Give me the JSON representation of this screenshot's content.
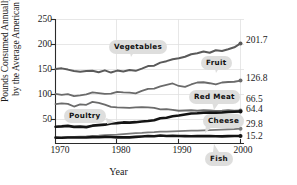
{
  "chart_data": {
    "type": "line",
    "title": "",
    "xlabel": "Year",
    "ylabel_line1": "Pounds Consumed Annually",
    "ylabel_line2": "by the Average American",
    "xlim": [
      1970,
      2000
    ],
    "ylim": [
      0,
      250
    ],
    "yticks": [
      250,
      200,
      150,
      100,
      50
    ],
    "xticks": [
      1970,
      1980,
      1990,
      2000
    ],
    "grid": true,
    "legend": "inline-callouts",
    "end_value_labels": [
      "201.7",
      "126.8",
      "66.5",
      "64.4",
      "29.8",
      "15.2"
    ],
    "series": [
      {
        "name": "Vegetables",
        "color": "#5a5a5a",
        "width": 2.0,
        "end_value": 201.7,
        "x": [
          1970,
          1971,
          1972,
          1973,
          1974,
          1975,
          1976,
          1977,
          1978,
          1979,
          1980,
          1981,
          1982,
          1983,
          1984,
          1985,
          1986,
          1987,
          1988,
          1989,
          1990,
          1991,
          1992,
          1993,
          1994,
          1995,
          1996,
          1997,
          1998,
          1999,
          2000
        ],
        "values": [
          150.0,
          151.5,
          149.0,
          146.0,
          144.5,
          146.0,
          146.5,
          143.5,
          147.5,
          143.0,
          147.0,
          145.0,
          148.0,
          146.5,
          151.0,
          156.0,
          157.0,
          163.0,
          166.0,
          170.0,
          172.0,
          175.0,
          180.0,
          182.0,
          185.5,
          183.0,
          188.0,
          186.5,
          190.0,
          194.0,
          201.7
        ]
      },
      {
        "name": "Fruit",
        "color": "#6b6b6b",
        "width": 1.8,
        "end_value": 126.8,
        "x": [
          1970,
          1971,
          1972,
          1973,
          1974,
          1975,
          1976,
          1977,
          1978,
          1979,
          1980,
          1981,
          1982,
          1983,
          1984,
          1985,
          1986,
          1987,
          1988,
          1989,
          1990,
          1991,
          1992,
          1993,
          1994,
          1995,
          1996,
          1997,
          1998,
          1999,
          2000
        ],
        "values": [
          100.0,
          98.0,
          99.5,
          95.5,
          97.0,
          99.0,
          103.0,
          101.5,
          100.0,
          100.5,
          104.0,
          103.0,
          102.5,
          101.0,
          106.0,
          110.0,
          110.5,
          115.0,
          118.0,
          121.0,
          116.0,
          114.0,
          119.0,
          123.0,
          123.5,
          121.5,
          119.0,
          123.0,
          124.0,
          124.5,
          126.8
        ]
      },
      {
        "name": "Red Meat",
        "color": "#6b6b6b",
        "width": 1.8,
        "end_value": 66.5,
        "x": [
          1970,
          1971,
          1972,
          1973,
          1974,
          1975,
          1976,
          1977,
          1978,
          1979,
          1980,
          1981,
          1982,
          1983,
          1984,
          1985,
          1986,
          1987,
          1988,
          1989,
          1990,
          1991,
          1992,
          1993,
          1994,
          1995,
          1996,
          1997,
          1998,
          1999,
          2000
        ],
        "values": [
          79.5,
          81.0,
          80.0,
          74.5,
          79.0,
          78.0,
          84.0,
          82.0,
          78.5,
          74.0,
          73.0,
          72.5,
          72.0,
          73.0,
          73.5,
          73.0,
          72.0,
          69.0,
          69.5,
          68.0,
          66.0,
          66.5,
          67.0,
          66.0,
          67.0,
          66.5,
          65.5,
          66.0,
          67.0,
          66.0,
          66.5
        ]
      },
      {
        "name": "Poultry",
        "color": "#141414",
        "width": 2.6,
        "end_value": 64.4,
        "x": [
          1970,
          1971,
          1972,
          1973,
          1974,
          1975,
          1976,
          1977,
          1978,
          1979,
          1980,
          1981,
          1982,
          1983,
          1984,
          1985,
          1986,
          1987,
          1988,
          1989,
          1990,
          1991,
          1992,
          1993,
          1994,
          1995,
          1996,
          1997,
          1998,
          1999,
          2000
        ],
        "values": [
          33.8,
          34.5,
          35.5,
          33.5,
          34.0,
          33.0,
          36.0,
          37.0,
          38.0,
          40.5,
          41.0,
          42.5,
          42.0,
          43.0,
          44.5,
          45.5,
          47.0,
          51.0,
          52.0,
          55.0,
          56.5,
          58.5,
          60.5,
          61.0,
          62.0,
          62.5,
          62.0,
          62.5,
          63.5,
          64.0,
          64.4
        ]
      },
      {
        "name": "Cheese",
        "color": "#7a7a7a",
        "width": 1.8,
        "end_value": 29.8,
        "x": [
          1970,
          1971,
          1972,
          1973,
          1974,
          1975,
          1976,
          1977,
          1978,
          1979,
          1980,
          1981,
          1982,
          1983,
          1984,
          1985,
          1986,
          1987,
          1988,
          1989,
          1990,
          1991,
          1992,
          1993,
          1994,
          1995,
          1996,
          1997,
          1998,
          1999,
          2000
        ],
        "values": [
          11.3,
          12.0,
          13.0,
          13.5,
          14.0,
          14.5,
          15.5,
          16.0,
          17.0,
          17.5,
          18.0,
          19.0,
          20.0,
          21.0,
          21.5,
          22.5,
          23.0,
          24.0,
          24.0,
          24.5,
          25.0,
          25.5,
          26.0,
          26.0,
          26.5,
          27.0,
          27.5,
          28.0,
          28.5,
          29.0,
          29.8
        ]
      },
      {
        "name": "Fish",
        "color": "#141414",
        "width": 2.6,
        "end_value": 15.2,
        "x": [
          1970,
          1971,
          1972,
          1973,
          1974,
          1975,
          1976,
          1977,
          1978,
          1979,
          1980,
          1981,
          1982,
          1983,
          1984,
          1985,
          1986,
          1987,
          1988,
          1989,
          1990,
          1991,
          1992,
          1993,
          1994,
          1995,
          1996,
          1997,
          1998,
          1999,
          2000
        ],
        "values": [
          11.8,
          11.5,
          12.2,
          12.0,
          12.1,
          12.2,
          12.9,
          12.6,
          13.4,
          13.0,
          12.4,
          12.6,
          12.3,
          13.3,
          14.1,
          15.0,
          14.7,
          16.1,
          15.1,
          15.6,
          15.0,
          14.8,
          14.7,
          14.9,
          15.1,
          14.9,
          14.7,
          14.3,
          14.8,
          15.0,
          15.2
        ]
      }
    ]
  },
  "callouts": [
    {
      "label": "Vegetables"
    },
    {
      "label": "Fruit"
    },
    {
      "label": "Red Meat"
    },
    {
      "label": "Poultry"
    },
    {
      "label": "Cheese"
    },
    {
      "label": "Fish"
    }
  ]
}
